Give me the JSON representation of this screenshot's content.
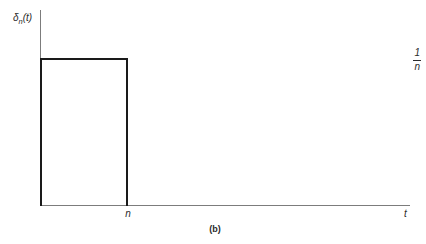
{
  "figure": {
    "caption": "(b)",
    "background_color": "#ffffff",
    "curve_color": "#1a1a1a",
    "axis_color": "#7c7c7c",
    "text_color": "#2b2b2b"
  },
  "axes": {
    "y_axis_label_symbol": "δ",
    "y_axis_label_subscript": "n",
    "y_axis_label_arg": "(t)",
    "x_axis_label": "t",
    "y_ticks": [
      {
        "numerator": "1",
        "denominator": "n"
      }
    ],
    "x_ticks": [
      {
        "label": "n"
      }
    ]
  },
  "chart_data": {
    "type": "line",
    "title": "(b)",
    "xlabel": "t",
    "ylabel": "δn(t)",
    "x": [
      0,
      0,
      1,
      1
    ],
    "values": [
      0,
      1,
      1,
      0
    ],
    "series": [
      {
        "name": "δn(t)",
        "x": [
          0,
          0,
          1,
          1
        ],
        "values": [
          0,
          1,
          1,
          0
        ]
      }
    ],
    "xlim": [
      0,
      4.2
    ],
    "ylim": [
      0,
      1.32
    ],
    "xtick_labels": [
      "n"
    ],
    "xtick_values": [
      1
    ],
    "ytick_labels": [
      "1/n"
    ],
    "ytick_values": [
      1
    ],
    "grid": false,
    "legend": "none",
    "annotations": [
      "Rectangular pulse of height 1/n on the interval 0 to n",
      "Area under the pulse equals 1"
    ]
  }
}
